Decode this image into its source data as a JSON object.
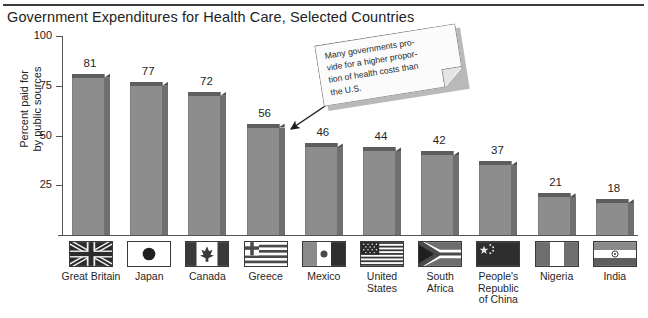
{
  "chart_data": {
    "type": "bar",
    "title": "Government Expenditures for Health Care, Selected Countries",
    "xlabel": "",
    "ylabel": "Percent paid for by public sources",
    "ylim": [
      0,
      100
    ],
    "yticks": [
      100,
      75,
      50,
      25
    ],
    "grid": false,
    "legend": "none",
    "categories": [
      "Great Britain",
      "Japan",
      "Canada",
      "Greece",
      "Mexico",
      "United States",
      "South Africa",
      "People's Republic of China",
      "Nigeria",
      "India"
    ],
    "values": [
      81,
      77,
      72,
      56,
      46,
      44,
      42,
      37,
      21,
      18
    ],
    "annotations": [
      {
        "text": "Many governments provide for a higher proportion of health costs than the U.S.",
        "points_to": "Greece"
      }
    ]
  },
  "header": {
    "title": "Government Expenditures for Health Care, Selected Countries"
  },
  "axis": {
    "y_title_line1": "Percent paid for",
    "y_title_line2": "by public sources",
    "y_ticks": [
      "100",
      "75",
      "50",
      "25"
    ]
  },
  "bars": [
    {
      "value_label": "81",
      "country": "Great Britain",
      "flag": "flag-great-britain",
      "label_lines": [
        "Great Britain"
      ]
    },
    {
      "value_label": "77",
      "country": "Japan",
      "flag": "flag-japan",
      "label_lines": [
        "Japan"
      ]
    },
    {
      "value_label": "72",
      "country": "Canada",
      "flag": "flag-canada",
      "label_lines": [
        "Canada"
      ]
    },
    {
      "value_label": "56",
      "country": "Greece",
      "flag": "flag-greece",
      "label_lines": [
        "Greece"
      ]
    },
    {
      "value_label": "46",
      "country": "Mexico",
      "flag": "flag-mexico",
      "label_lines": [
        "Mexico"
      ]
    },
    {
      "value_label": "44",
      "country": "United States",
      "flag": "flag-united-states",
      "label_lines": [
        "United",
        "States"
      ]
    },
    {
      "value_label": "42",
      "country": "South Africa",
      "flag": "flag-south-africa",
      "label_lines": [
        "South",
        "Africa"
      ]
    },
    {
      "value_label": "37",
      "country": "People's Republic of China",
      "flag": "flag-china",
      "label_lines": [
        "People's",
        "Republic",
        "of China"
      ]
    },
    {
      "value_label": "21",
      "country": "Nigeria",
      "flag": "flag-nigeria",
      "label_lines": [
        "Nigeria"
      ]
    },
    {
      "value_label": "18",
      "country": "India",
      "flag": "flag-india",
      "label_lines": [
        "India"
      ]
    }
  ],
  "callout": {
    "line1": "Many governments pro-",
    "line2": "vide for a higher propor-",
    "line3": "tion of health costs than",
    "line4": "the U.S."
  },
  "colors": {
    "bar_front": "#8d8d8d",
    "bar_cap": "#5e5e5e",
    "bar_side": "#6f6f6f",
    "axis": "#555555",
    "rule": "#3b3b3b",
    "text": "#1f1f1f",
    "note_bg": "#fbfbfb"
  }
}
